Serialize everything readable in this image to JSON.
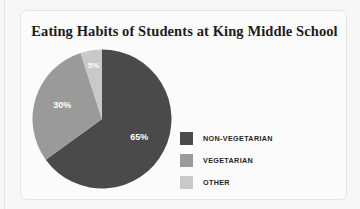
{
  "chart_data": {
    "type": "pie",
    "title": "Eating Habits of Students at King Middle School",
    "categories": [
      "NON-VEGETARIAN",
      "VEGETARIAN",
      "OTHER"
    ],
    "values": [
      65,
      30,
      5
    ],
    "labels": [
      "65%",
      "30%",
      "5%"
    ],
    "colors": [
      "#4a4a4a",
      "#9a9a9a",
      "#c9c9c9"
    ],
    "unit": "%",
    "legend_position": "right",
    "grid": false,
    "start_angle_deg": 0,
    "direction": "clockwise",
    "xlabel": "",
    "ylabel": ""
  },
  "card": {
    "background": "#fbfbfb",
    "border_color": "#e4e4e4"
  },
  "legend": {
    "items": [
      {
        "label": "NON-VEGETARIAN",
        "color": "#4a4a4a"
      },
      {
        "label": "VEGETARIAN",
        "color": "#9a9a9a"
      },
      {
        "label": "OTHER",
        "color": "#c9c9c9"
      }
    ]
  }
}
